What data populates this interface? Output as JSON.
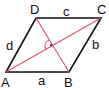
{
  "diagram": {
    "vertices": {
      "A": "A",
      "B": "B",
      "C": "C",
      "D": "D"
    },
    "sides": {
      "a": "a",
      "b": "b",
      "c": "c",
      "d": "d"
    },
    "colors": {
      "outline": "#111111",
      "diagonal": "#e0506a"
    },
    "right_angle_marker": "·"
  }
}
